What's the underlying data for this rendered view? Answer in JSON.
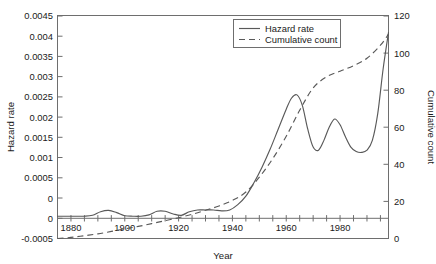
{
  "chart_data": {
    "type": "line",
    "title": "",
    "xlabel": "Year",
    "ylabel": "Hazard rate",
    "y2label": "Cumulative count",
    "xlim": [
      1875,
      1998
    ],
    "ylim": [
      -0.0005,
      0.0045
    ],
    "y2lim": [
      0,
      120
    ],
    "grid": false,
    "legend_position": "top-center",
    "x_tick_labels": [
      "1880",
      "1900",
      "1920",
      "1940",
      "1960",
      "1980"
    ],
    "x_tick_values": [
      1880,
      1900,
      1920,
      1940,
      1960,
      1980
    ],
    "x_minor_tick_step": 5,
    "y_tick_labels": [
      "-0.0005",
      "0",
      "0.0005",
      "0.001",
      "0.0015",
      "0.002",
      "0.0025",
      "0.003",
      "0.0035",
      "0.004",
      "0.0045"
    ],
    "y_tick_values": [
      -0.0005,
      0,
      0.0005,
      0.001,
      0.0015,
      0.002,
      0.0025,
      0.003,
      0.0035,
      0.004,
      0.0045
    ],
    "y2_tick_labels": [
      "0",
      "20",
      "40",
      "60",
      "80",
      "100",
      "120"
    ],
    "y2_tick_values": [
      0,
      20,
      40,
      60,
      80,
      100,
      120
    ],
    "series": [
      {
        "name": "Hazard rate",
        "style": "solid",
        "axis": "left",
        "x": [
          1875,
          1880,
          1885,
          1888,
          1891,
          1894,
          1897,
          1900,
          1903,
          1906,
          1909,
          1912,
          1915,
          1918,
          1921,
          1924,
          1927,
          1930,
          1933,
          1936,
          1939,
          1942,
          1945,
          1948,
          1951,
          1954,
          1957,
          1960,
          1962,
          1964,
          1966,
          1968,
          1970,
          1972,
          1974,
          1976,
          1978,
          1980,
          1982,
          1984,
          1986,
          1988,
          1990,
          1992,
          1994,
          1996,
          1998
        ],
        "y": [
          0.0,
          0.0,
          0.0,
          2e-05,
          0.0001,
          0.00013,
          8e-05,
          1e-05,
          0.0,
          0.0,
          3e-05,
          0.00011,
          0.00011,
          5e-05,
          2e-05,
          0.0001,
          0.00014,
          0.00014,
          0.00014,
          0.00012,
          0.00014,
          0.00026,
          0.00045,
          0.00075,
          0.0011,
          0.0015,
          0.00195,
          0.0024,
          0.00265,
          0.00272,
          0.00248,
          0.00195,
          0.00155,
          0.00148,
          0.0017,
          0.002,
          0.00218,
          0.00205,
          0.00178,
          0.00155,
          0.00145,
          0.00143,
          0.00148,
          0.0017,
          0.0023,
          0.0033,
          0.00412
        ]
      },
      {
        "name": "Cumulative count",
        "style": "dashed",
        "axis": "right",
        "x": [
          1875,
          1880,
          1885,
          1890,
          1895,
          1900,
          1905,
          1910,
          1915,
          1920,
          1925,
          1930,
          1935,
          1940,
          1945,
          1950,
          1955,
          1960,
          1965,
          1970,
          1975,
          1980,
          1985,
          1990,
          1995,
          1998
        ],
        "y": [
          0,
          0.6,
          1.5,
          2.5,
          3.8,
          5.2,
          6.5,
          8.0,
          9.6,
          11.2,
          13.0,
          15.2,
          17.5,
          20.5,
          25.0,
          33.0,
          43.0,
          55.0,
          69.0,
          81.0,
          87.0,
          90.0,
          93.0,
          97.0,
          104.0,
          110.0
        ]
      }
    ],
    "legend_entries": [
      {
        "label": "Hazard rate",
        "style": "solid"
      },
      {
        "label": "Cumulative count",
        "style": "dashed"
      }
    ]
  }
}
